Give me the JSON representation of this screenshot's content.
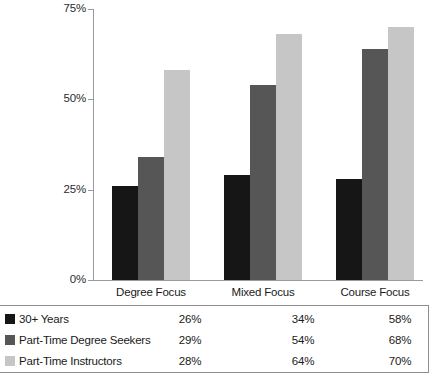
{
  "chart_data": {
    "type": "bar",
    "title": "",
    "subtitle": "",
    "xlabel": "",
    "ylabel": "",
    "ylim": [
      0,
      75
    ],
    "y_ticks": [
      "0%",
      "25%",
      "50%",
      "75%"
    ],
    "y_tick_values": [
      0,
      25,
      50,
      75
    ],
    "grid": false,
    "legend_position": "bottom-table",
    "categories": [
      "Degree Focus",
      "Mixed Focus",
      "Course Focus"
    ],
    "series": [
      {
        "name": "30+ Years",
        "color": "#161616",
        "values": [
          26,
          29,
          28
        ],
        "labels": [
          "26%",
          "29%",
          "28%"
        ]
      },
      {
        "name": "Part-Time Degree Seekers",
        "color": "#565656",
        "values": [
          34,
          54,
          64
        ],
        "labels": [
          "34%",
          "54%",
          "64%"
        ]
      },
      {
        "name": "Part-Time Instructors",
        "color": "#c6c6c6",
        "values": [
          58,
          68,
          70
        ],
        "labels": [
          "58%",
          "68%",
          "70%"
        ]
      }
    ],
    "table": {
      "columns": [
        "Degree Focus",
        "Mixed Focus",
        "Course Focus"
      ],
      "rows": [
        {
          "label": "30+ Years",
          "swatch": "#161616",
          "values": [
            "26%",
            "34%",
            "58%"
          ]
        },
        {
          "label": "Part-Time Degree Seekers",
          "swatch": "#565656",
          "values": [
            "29%",
            "54%",
            "68%"
          ]
        },
        {
          "label": "Part-Time Instructors",
          "swatch": "#c6c6c6",
          "values": [
            "28%",
            "64%",
            "70%"
          ]
        }
      ]
    }
  }
}
